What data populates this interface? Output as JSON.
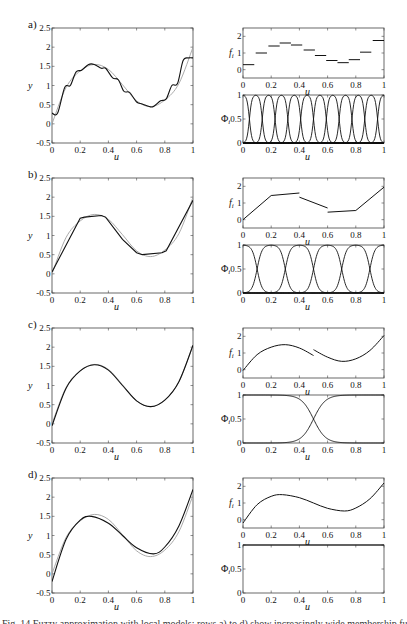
{
  "figure": {
    "caption_partial": "Fig. 14 Fuzzy approximation with local models: rows a) to d) show increasingly wide membership functions",
    "colors": {
      "fit": "#111111",
      "target": "#a0a0a0",
      "axis": "#444444"
    }
  },
  "chart_data": [
    {
      "panel": "a)",
      "type": "line",
      "title": "",
      "xlabel": "u",
      "ylabel": "y",
      "xlim": [
        0,
        1
      ],
      "ylim": [
        -0.5,
        2.5
      ],
      "xticks": [
        "0",
        "0.2",
        "0.4",
        "0.6",
        "0.8",
        "1"
      ],
      "yticks": [
        "-0.5",
        "0",
        "0.5",
        "1",
        "1.5",
        "2",
        "2.5"
      ],
      "series": [
        {
          "name": "target function (gray)",
          "x": [
            0,
            0.1,
            0.2,
            0.3,
            0.4,
            0.5,
            0.6,
            0.7,
            0.8,
            0.9,
            1
          ],
          "values": [
            0,
            0.95,
            1.38,
            1.55,
            1.42,
            1.02,
            0.6,
            0.45,
            0.62,
            1.05,
            2.0
          ]
        },
        {
          "name": "fuzzy model (black)",
          "x": [
            0,
            0.04,
            0.09,
            0.13,
            0.17,
            0.21,
            0.26,
            0.3,
            0.35,
            0.38,
            0.43,
            0.47,
            0.51,
            0.55,
            0.6,
            0.64,
            0.69,
            0.72,
            0.77,
            0.81,
            0.85,
            0.89,
            0.93,
            0.97,
            1
          ],
          "values": [
            0.28,
            0.28,
            0.95,
            1.0,
            1.35,
            1.4,
            1.55,
            1.55,
            1.45,
            1.45,
            1.2,
            1.15,
            0.85,
            0.82,
            0.57,
            0.52,
            0.45,
            0.45,
            0.6,
            0.65,
            1.0,
            1.05,
            1.65,
            1.72,
            1.72
          ]
        }
      ],
      "local_models": {
        "ylabel": "f_i",
        "ylim": [
          -0.5,
          2.5
        ],
        "yticks": [
          "0",
          "1",
          "2"
        ],
        "type": "step",
        "segments": [
          {
            "x0": 0.0,
            "x1": 0.08,
            "y": 0.3
          },
          {
            "x0": 0.09,
            "x1": 0.17,
            "y": 1.0
          },
          {
            "x0": 0.18,
            "x1": 0.26,
            "y": 1.42
          },
          {
            "x0": 0.26,
            "x1": 0.34,
            "y": 1.6
          },
          {
            "x0": 0.34,
            "x1": 0.42,
            "y": 1.48
          },
          {
            "x0": 0.43,
            "x1": 0.51,
            "y": 1.18
          },
          {
            "x0": 0.51,
            "x1": 0.59,
            "y": 0.85
          },
          {
            "x0": 0.59,
            "x1": 0.67,
            "y": 0.55
          },
          {
            "x0": 0.67,
            "x1": 0.75,
            "y": 0.42
          },
          {
            "x0": 0.75,
            "x1": 0.83,
            "y": 0.6
          },
          {
            "x0": 0.83,
            "x1": 0.91,
            "y": 1.05
          },
          {
            "x0": 0.92,
            "x1": 1.0,
            "y": 1.75
          }
        ]
      },
      "memberships": {
        "ylabel": "Φ_i",
        "ylim": [
          0,
          1
        ],
        "yticks": [
          "0",
          "0.5",
          "1"
        ],
        "count": 12,
        "centers": [
          0,
          0.0909,
          0.1818,
          0.2727,
          0.3636,
          0.4545,
          0.5455,
          0.6364,
          0.7273,
          0.8182,
          0.9091,
          1
        ],
        "width": 0.035
      }
    },
    {
      "panel": "b)",
      "type": "line",
      "xlabel": "u",
      "ylabel": "y",
      "xlim": [
        0,
        1
      ],
      "ylim": [
        -0.5,
        2.5
      ],
      "xticks": [
        "0",
        "0.2",
        "0.4",
        "0.6",
        "0.8",
        "1"
      ],
      "yticks": [
        "-0.5",
        "0",
        "0.5",
        "1",
        "1.5",
        "2",
        "2.5"
      ],
      "series": [
        {
          "name": "target function (gray)",
          "x": [
            0,
            0.1,
            0.2,
            0.3,
            0.4,
            0.5,
            0.6,
            0.7,
            0.8,
            0.9,
            1
          ],
          "values": [
            0,
            0.95,
            1.38,
            1.55,
            1.42,
            1.02,
            0.6,
            0.45,
            0.62,
            1.05,
            2.0
          ]
        },
        {
          "name": "fuzzy model (black)",
          "x": [
            0,
            0.2,
            0.23,
            0.35,
            0.38,
            0.5,
            0.6,
            0.64,
            0.78,
            0.81,
            1
          ],
          "values": [
            0.05,
            1.45,
            1.48,
            1.52,
            1.48,
            0.9,
            0.55,
            0.5,
            0.55,
            0.6,
            1.92
          ]
        }
      ],
      "local_models": {
        "ylabel": "f_i",
        "ylim": [
          -0.5,
          2.5
        ],
        "yticks": [
          "0",
          "1",
          "2"
        ],
        "type": "piecewise-linear",
        "segments": [
          {
            "x": [
              0,
              0.2,
              0.4
            ],
            "values": [
              0.0,
              1.45,
              1.6
            ]
          },
          {
            "x": [
              0.4,
              0.6
            ],
            "values": [
              1.35,
              0.7
            ]
          },
          {
            "x": [
              0.6,
              0.8,
              1.0
            ],
            "values": [
              0.45,
              0.55,
              1.95
            ]
          }
        ]
      },
      "memberships": {
        "ylabel": "Φ_i",
        "ylim": [
          0,
          1
        ],
        "yticks": [
          "0",
          "0.5",
          "1"
        ],
        "count": 6,
        "centers": [
          0,
          0.2,
          0.4,
          0.6,
          0.8,
          1
        ],
        "width": 0.07
      }
    },
    {
      "panel": "c)",
      "type": "line",
      "xlabel": "u",
      "ylabel": "y",
      "xlim": [
        0,
        1
      ],
      "ylim": [
        -0.5,
        2.5
      ],
      "xticks": [
        "0",
        "0.2",
        "0.4",
        "0.6",
        "0.8",
        "1"
      ],
      "yticks": [
        "-0.5",
        "0",
        "0.5",
        "1",
        "1.5",
        "2",
        "2.5"
      ],
      "series": [
        {
          "name": "target function (gray)",
          "x": [
            0,
            0.1,
            0.2,
            0.3,
            0.4,
            0.5,
            0.6,
            0.7,
            0.8,
            0.9,
            1
          ],
          "values": [
            0,
            0.95,
            1.38,
            1.55,
            1.42,
            1.02,
            0.6,
            0.45,
            0.62,
            1.1,
            2.05
          ]
        },
        {
          "name": "fuzzy model (black)",
          "x": [
            0,
            0.1,
            0.2,
            0.3,
            0.4,
            0.5,
            0.6,
            0.7,
            0.8,
            0.9,
            1
          ],
          "values": [
            -0.05,
            0.93,
            1.38,
            1.54,
            1.4,
            1.0,
            0.6,
            0.45,
            0.62,
            1.1,
            2.05
          ]
        }
      ],
      "local_models": {
        "ylabel": "f_i",
        "ylim": [
          -0.5,
          2.5
        ],
        "yticks": [
          "0",
          "1",
          "2"
        ],
        "type": "piecewise-curve",
        "segments": [
          {
            "x": [
              0,
              0.1,
              0.2,
              0.3,
              0.4,
              0.5
            ],
            "values": [
              -0.05,
              0.9,
              1.35,
              1.5,
              1.3,
              0.85
            ]
          },
          {
            "x": [
              0.5,
              0.6,
              0.7,
              0.8,
              0.9,
              1
            ],
            "values": [
              1.2,
              0.75,
              0.5,
              0.65,
              1.15,
              2.05
            ]
          }
        ]
      },
      "memberships": {
        "ylabel": "Φ_i",
        "ylim": [
          0,
          1
        ],
        "yticks": [
          "0",
          "0.5",
          "1"
        ],
        "count": 2,
        "centers": [
          0,
          1
        ],
        "crossover": 0.5,
        "width": 0.17
      }
    },
    {
      "panel": "d)",
      "type": "line",
      "xlabel": "u",
      "ylabel": "y",
      "xlim": [
        0,
        1
      ],
      "ylim": [
        -0.5,
        2.5
      ],
      "xticks": [
        "0",
        "0.2",
        "0.4",
        "0.6",
        "0.8",
        "1"
      ],
      "yticks": [
        "-0.5",
        "0",
        "0.5",
        "1",
        "1.5",
        "2",
        "2.5"
      ],
      "series": [
        {
          "name": "target function (gray)",
          "x": [
            0,
            0.1,
            0.2,
            0.3,
            0.4,
            0.5,
            0.6,
            0.7,
            0.8,
            0.9,
            1
          ],
          "values": [
            0,
            0.95,
            1.38,
            1.55,
            1.42,
            1.02,
            0.6,
            0.45,
            0.62,
            1.1,
            2.05
          ]
        },
        {
          "name": "fuzzy model (black)",
          "x": [
            0,
            0.1,
            0.2,
            0.28,
            0.4,
            0.5,
            0.6,
            0.72,
            0.8,
            0.9,
            1
          ],
          "values": [
            -0.2,
            0.9,
            1.4,
            1.5,
            1.32,
            1.0,
            0.68,
            0.52,
            0.7,
            1.25,
            2.2
          ]
        }
      ],
      "local_models": {
        "ylabel": "f_i",
        "ylim": [
          -0.5,
          2.5
        ],
        "yticks": [
          "0",
          "1",
          "2"
        ],
        "type": "curve",
        "segments": [
          {
            "x": [
              0,
              0.1,
              0.2,
              0.28,
              0.4,
              0.5,
              0.6,
              0.72,
              0.8,
              0.9,
              1
            ],
            "values": [
              -0.2,
              0.9,
              1.4,
              1.5,
              1.32,
              1.0,
              0.68,
              0.52,
              0.7,
              1.25,
              2.2
            ]
          }
        ]
      },
      "memberships": {
        "ylabel": "Φ_i",
        "ylim": [
          0,
          1
        ],
        "yticks": [
          "0",
          "0.5",
          "1"
        ],
        "count": 1,
        "constant": 1
      }
    }
  ]
}
